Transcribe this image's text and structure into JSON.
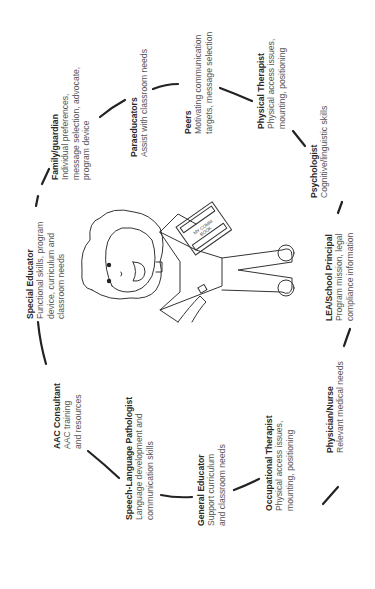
{
  "diagram": {
    "orientation": "rotated -90deg (text reads bottom-to-top)",
    "center_figure": {
      "description": "line drawing of a child holding a communication book",
      "book_text": [
        "MY COMM",
        "BOOK"
      ]
    },
    "roles": [
      {
        "id": "family-guardian",
        "role": "Family/guardian",
        "lines": [
          "Individual preferences,",
          "message selection, advocate,",
          "program device"
        ]
      },
      {
        "id": "paraeducators",
        "role": "Paraeducators",
        "lines": [
          "Assist with classroom needs"
        ]
      },
      {
        "id": "peers",
        "role": "Peers",
        "lines": [
          "Motivating communication",
          "targets, message selection"
        ]
      },
      {
        "id": "physical-therapist",
        "role": "Physical Therapist",
        "lines": [
          "Physical access issues,",
          "mounting, positioning"
        ]
      },
      {
        "id": "psychologist",
        "role": "Psychologist",
        "lines": [
          "Cognitive/linguistic skills"
        ]
      },
      {
        "id": "lea-school-principal",
        "role": "LEA/School Principal",
        "lines": [
          "Program mission, legal",
          "compliance information"
        ]
      },
      {
        "id": "physician-nurse",
        "role": "Physician/Nurse",
        "lines": [
          "Relevant medical needs"
        ]
      },
      {
        "id": "occupational-therapist",
        "role": "Occupational Therapist",
        "lines": [
          "Physical access issues,",
          "mounting, positioning"
        ]
      },
      {
        "id": "general-educator",
        "role": "General Educator",
        "lines": [
          "Support curriculum",
          "and classroom needs"
        ]
      },
      {
        "id": "speech-language-pathologist",
        "role": "Speech-Language Pathologist",
        "lines": [
          "Language development and",
          "communication skills"
        ]
      },
      {
        "id": "aac-consultant",
        "role": "AAC Consultant",
        "lines": [
          "AAC training",
          "and resources"
        ]
      },
      {
        "id": "special-educator",
        "role": "Special Educator",
        "lines": [
          "Functional skills, program",
          "device, curriculum and",
          "classroom needs"
        ]
      }
    ]
  }
}
